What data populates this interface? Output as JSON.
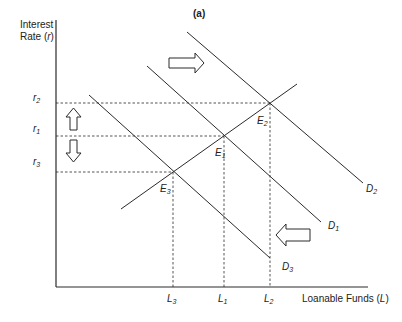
{
  "diagram": {
    "panel_label": "(a)",
    "y_axis": {
      "line1": "Interest",
      "line2_prefix": "Rate (",
      "line2_var": "r",
      "line2_suffix": ")"
    },
    "x_axis": {
      "prefix": "Loanable Funds (",
      "var": "L",
      "suffix": ")"
    },
    "y_ticks": [
      {
        "base": "r",
        "sub": "2"
      },
      {
        "base": "r",
        "sub": "1"
      },
      {
        "base": "r",
        "sub": "3"
      }
    ],
    "x_ticks": [
      {
        "base": "L",
        "sub": "3"
      },
      {
        "base": "L",
        "sub": "1"
      },
      {
        "base": "L",
        "sub": "2"
      }
    ],
    "curves": [
      {
        "base": "D",
        "sub": "2"
      },
      {
        "base": "D",
        "sub": "1"
      },
      {
        "base": "D",
        "sub": "3"
      }
    ],
    "equilibria": [
      {
        "base": "E",
        "sub": "2"
      },
      {
        "base": "E",
        "sub": "1"
      },
      {
        "base": "E",
        "sub": "3"
      }
    ],
    "colors": {
      "line": "#2a2a2a",
      "background": "#ffffff"
    }
  }
}
